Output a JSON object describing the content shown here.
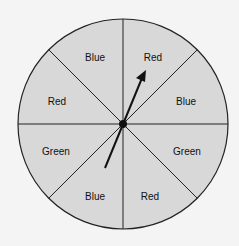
{
  "diagram": {
    "type": "spinner",
    "sections": [
      {
        "label": "Red",
        "position": "top-right"
      },
      {
        "label": "Blue",
        "position": "right-upper"
      },
      {
        "label": "Green",
        "position": "right-lower"
      },
      {
        "label": "Red",
        "position": "bottom-right"
      },
      {
        "label": "Blue",
        "position": "bottom-left"
      },
      {
        "label": "Green",
        "position": "left-lower"
      },
      {
        "label": "Red",
        "position": "left-upper"
      },
      {
        "label": "Blue",
        "position": "top-left"
      }
    ],
    "pointer": {
      "pointing_to": "Red"
    },
    "colors": {
      "fill": "#d8d8d8",
      "stroke": "#222222",
      "background": "#f4f4f4"
    }
  }
}
